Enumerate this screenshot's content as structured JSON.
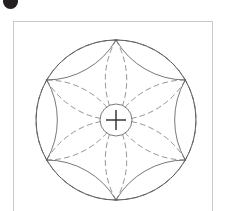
{
  "header": {
    "badge_icon": "dark-circle-badge-icon",
    "title": "",
    "badge_color": "#231f20",
    "title_color": "#b9b9bd"
  },
  "frame": {
    "border_color": "#c9c9cc",
    "background": "#ffffff",
    "x": 13,
    "y": 21,
    "width": 200,
    "height": 195
  },
  "figure": {
    "name": "six-petal-rosette-construction",
    "center_x": 115,
    "center_y": 119,
    "node_radius": 80,
    "node_count": 6,
    "node_angles_deg": [
      270,
      330,
      30,
      90,
      150,
      210
    ],
    "solid_stroke": "#555558",
    "dashed_stroke": "#7a7a7e",
    "stroke_width": 0.8,
    "dash_pattern": "5,4",
    "center_marker": {
      "name": "center-crosshair",
      "circle_radius": 16,
      "crosshair_arm": 10,
      "circle_stroke": "#555558",
      "cross_stroke": "#2b2b2d"
    }
  }
}
